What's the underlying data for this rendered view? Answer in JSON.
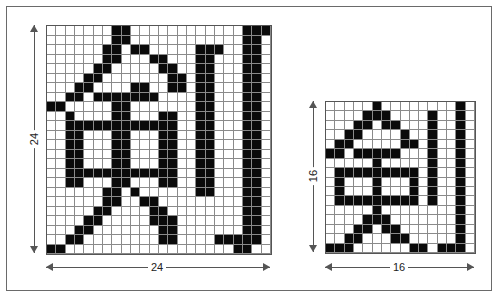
{
  "figure": {
    "large": {
      "cols": 24,
      "rows": 24,
      "width_label": "24",
      "height_label": "24",
      "on_cells": {
        "0": [
          7,
          8,
          21,
          22,
          23
        ],
        "1": [
          7,
          8,
          21,
          22
        ],
        "2": [
          6,
          7,
          9,
          10,
          16,
          17,
          18,
          21,
          22
        ],
        "3": [
          6,
          7,
          11,
          12,
          16,
          17,
          21,
          22
        ],
        "4": [
          5,
          6,
          12,
          13,
          16,
          17,
          21,
          22
        ],
        "5": [
          4,
          5,
          13,
          14,
          16,
          17,
          21,
          22
        ],
        "6": [
          3,
          4,
          9,
          10,
          13,
          14,
          16,
          17,
          21,
          22
        ],
        "7": [
          2,
          3,
          5,
          6,
          7,
          8,
          9,
          10,
          11,
          16,
          17,
          21,
          22
        ],
        "8": [
          0,
          1,
          7,
          8,
          16,
          17,
          21,
          22
        ],
        "9": [
          2,
          7,
          8,
          12,
          13,
          16,
          17,
          21,
          22
        ],
        "10": [
          2,
          3,
          4,
          5,
          6,
          7,
          8,
          9,
          10,
          11,
          12,
          13,
          16,
          17,
          21,
          22
        ],
        "11": [
          2,
          3,
          7,
          8,
          12,
          13,
          16,
          17,
          21,
          22
        ],
        "12": [
          2,
          3,
          7,
          8,
          12,
          13,
          16,
          17,
          21,
          22
        ],
        "13": [
          2,
          3,
          7,
          8,
          12,
          13,
          16,
          17,
          21,
          22
        ],
        "14": [
          2,
          3,
          7,
          8,
          12,
          13,
          16,
          17,
          21,
          22
        ],
        "15": [
          2,
          3,
          4,
          5,
          6,
          7,
          8,
          9,
          10,
          11,
          12,
          13,
          16,
          17,
          21,
          22
        ],
        "16": [
          2,
          3,
          7,
          8,
          12,
          13,
          16,
          17,
          21,
          22
        ],
        "17": [
          6,
          7,
          9,
          16,
          17,
          21,
          22
        ],
        "18": [
          6,
          7,
          10,
          11,
          21,
          22
        ],
        "19": [
          5,
          6,
          11,
          12,
          21,
          22
        ],
        "20": [
          4,
          5,
          11,
          12,
          13,
          21,
          22
        ],
        "21": [
          3,
          4,
          12,
          13,
          21,
          22
        ],
        "22": [
          2,
          3,
          12,
          13,
          18,
          19,
          20,
          21,
          22
        ],
        "23": [
          0,
          1,
          20,
          21
        ]
      }
    },
    "small": {
      "cols": 16,
      "rows": 16,
      "width_label": "16",
      "height_label": "16",
      "on_cells": {
        "0": [
          5,
          14
        ],
        "1": [
          4,
          5,
          6,
          11,
          14
        ],
        "2": [
          3,
          4,
          6,
          7,
          11,
          14
        ],
        "3": [
          2,
          3,
          8,
          11,
          14
        ],
        "4": [
          1,
          2,
          8,
          9,
          11,
          14
        ],
        "5": [
          0,
          1,
          3,
          4,
          5,
          6,
          7,
          11,
          14
        ],
        "6": [
          5,
          11,
          14
        ],
        "7": [
          1,
          2,
          3,
          4,
          5,
          6,
          7,
          8,
          9,
          11,
          14
        ],
        "8": [
          1,
          5,
          9,
          11,
          14
        ],
        "9": [
          1,
          5,
          9,
          11,
          14
        ],
        "10": [
          1,
          2,
          3,
          4,
          5,
          6,
          7,
          8,
          9,
          11,
          14
        ],
        "11": [
          5,
          14
        ],
        "12": [
          4,
          5,
          6,
          14
        ],
        "13": [
          3,
          4,
          6,
          7,
          14
        ],
        "14": [
          2,
          3,
          7,
          8,
          14
        ],
        "15": [
          0,
          1,
          2,
          9,
          10,
          12,
          13,
          14
        ]
      }
    }
  }
}
